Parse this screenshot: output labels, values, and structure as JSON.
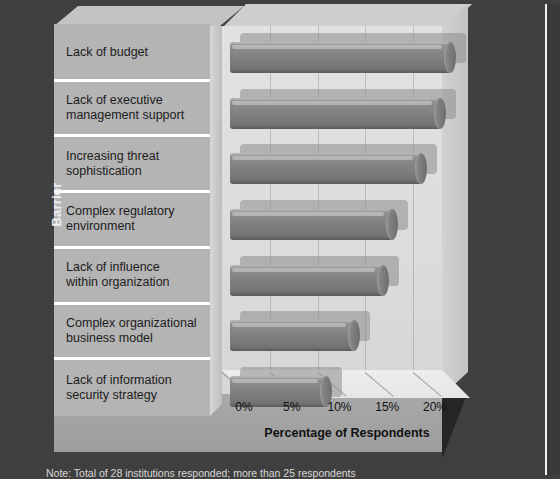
{
  "chart_data": {
    "type": "bar",
    "orientation": "horizontal",
    "title": "",
    "xlabel": "Percentage of Respondents",
    "ylabel": "Barrier",
    "categories": [
      "Lack of budget",
      "Lack of executive management support",
      "Increasing threat sophistication",
      "Complex regulatory environment",
      "Lack of influence within organization",
      "Complex organizational business model",
      "Lack of information security strategy"
    ],
    "values": [
      23,
      22,
      20,
      17,
      16,
      13,
      10
    ],
    "xlim": [
      0,
      25
    ],
    "xticks": [
      0,
      5,
      10,
      15,
      20
    ],
    "xtick_labels": [
      "0%",
      "5%",
      "10%",
      "15%",
      "20%"
    ],
    "grid": true,
    "legend": false,
    "style": "3d-cylinder-bars",
    "bar_color": "#7e7e7e",
    "panel_color": "#b4b4b4",
    "background_color": "#3f3f3f"
  },
  "categories_lines": [
    [
      "Lack of budget"
    ],
    [
      "Lack of executive",
      "management support"
    ],
    [
      "Increasing threat",
      "sophistication"
    ],
    [
      "Complex regulatory",
      "environment"
    ],
    [
      "Lack of influence",
      "within organization"
    ],
    [
      "Complex organizational",
      "business model"
    ],
    [
      "Lack of information",
      "security strategy"
    ]
  ],
  "axis": {
    "x_title": "Percentage of Respondents",
    "y_title": "Barrier",
    "ticks": [
      "0%",
      "5%",
      "10%",
      "15%",
      "20%"
    ]
  },
  "footnote": {
    "text": "Note: Total of 28 institutions responded; more than 25 respondents"
  }
}
